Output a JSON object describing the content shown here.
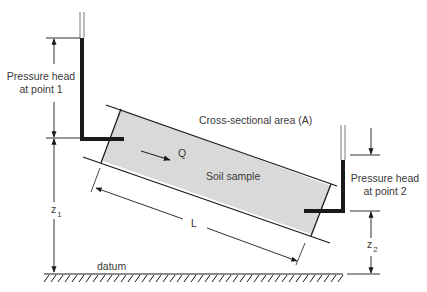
{
  "labels": {
    "pressure_head_1_line1": "Pressure head",
    "pressure_head_1_line2": "at point 1",
    "pressure_head_2_line1": "Pressure head",
    "pressure_head_2_line2": "at point 2",
    "cross_section": "Cross-sectional area (A)",
    "flow": "Q",
    "soil_sample": "Soil sample",
    "length": "L",
    "z1_base": "z",
    "z1_sub": "1",
    "z2_base": "z",
    "z2_sub": "2",
    "datum": "datum"
  },
  "colors": {
    "line": "#1a1a1a",
    "sample_fill": "#d9d9d9",
    "text": "#3a3a3a",
    "background": "#ffffff"
  }
}
